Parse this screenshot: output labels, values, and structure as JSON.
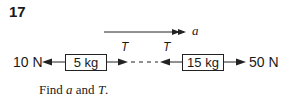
{
  "question": {
    "number": "17",
    "acceleration_label": "a",
    "left_force": "10 N",
    "right_force": "50 N",
    "mass_left": "5 kg",
    "mass_right": "15 kg",
    "tension_label_left": "T",
    "tension_label_right": "T",
    "prompt_prefix": "Find ",
    "prompt_a": "a",
    "prompt_mid": " and ",
    "prompt_T": "T",
    "prompt_suffix": "."
  }
}
